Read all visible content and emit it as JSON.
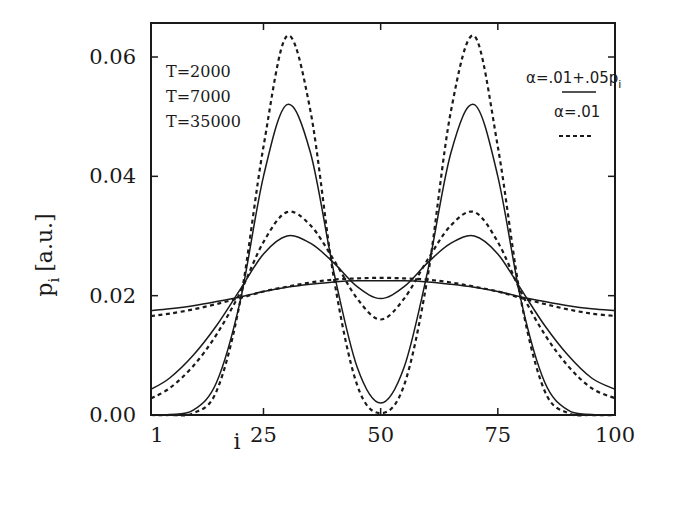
{
  "chart_data": {
    "type": "line",
    "title": "",
    "xlabel": "i",
    "ylabel": "p_i [a.u.]",
    "xlim": [
      1,
      100
    ],
    "ylim": [
      0.0,
      0.065
    ],
    "xticks": [
      1,
      25,
      50,
      75,
      100
    ],
    "yticks": [
      0.0,
      0.02,
      0.04,
      0.06
    ],
    "ytick_labels": [
      "0.00",
      "0.02",
      "0.04",
      "0.06"
    ],
    "xtick_labels": [
      "1",
      "25",
      "50",
      "75",
      "100"
    ],
    "grid": false,
    "annotations": [
      "T=2000",
      "T=7000",
      "T=35000"
    ],
    "legend": [
      {
        "label": "α=.01+.05p",
        "subscript": "i",
        "style": "solid"
      },
      {
        "label": "α=.01",
        "style": "dashed"
      }
    ],
    "legend_position": "upper right",
    "x": [
      1,
      5,
      10,
      15,
      20,
      25,
      30,
      35,
      40,
      45,
      50,
      55,
      60,
      65,
      70,
      75,
      80,
      85,
      90,
      95,
      100
    ],
    "series": [
      {
        "name": "T=2000, α=.01+.05p_i",
        "style": "solid",
        "values": [
          0.0175,
          0.0178,
          0.0183,
          0.019,
          0.0198,
          0.0207,
          0.0214,
          0.0219,
          0.0223,
          0.0225,
          0.0225,
          0.0225,
          0.0223,
          0.0219,
          0.0214,
          0.0207,
          0.0198,
          0.019,
          0.0183,
          0.0178,
          0.0175
        ]
      },
      {
        "name": "T=2000, α=.01",
        "style": "dashed",
        "values": [
          0.0166,
          0.017,
          0.0177,
          0.0186,
          0.0196,
          0.0207,
          0.0215,
          0.0222,
          0.0227,
          0.0229,
          0.023,
          0.0229,
          0.0227,
          0.0222,
          0.0215,
          0.0207,
          0.0196,
          0.0186,
          0.0177,
          0.017,
          0.0166
        ]
      },
      {
        "name": "T=7000, α=.01+.05p_i",
        "style": "solid",
        "values": [
          0.0043,
          0.0062,
          0.01,
          0.015,
          0.021,
          0.027,
          0.03,
          0.0288,
          0.0255,
          0.0215,
          0.0195,
          0.0215,
          0.0255,
          0.0288,
          0.03,
          0.027,
          0.021,
          0.015,
          0.01,
          0.0062,
          0.0043
        ]
      },
      {
        "name": "T=7000, α=.01",
        "style": "dashed",
        "values": [
          0.0028,
          0.0045,
          0.0082,
          0.0135,
          0.0205,
          0.029,
          0.034,
          0.0318,
          0.026,
          0.0195,
          0.016,
          0.0195,
          0.026,
          0.0318,
          0.034,
          0.029,
          0.0205,
          0.0135,
          0.0082,
          0.0045,
          0.0028
        ]
      },
      {
        "name": "T=35000, α=.01+.05p_i",
        "style": "solid",
        "values": [
          0.0,
          0.0001,
          0.0008,
          0.0055,
          0.019,
          0.04,
          0.052,
          0.044,
          0.024,
          0.008,
          0.002,
          0.008,
          0.024,
          0.044,
          0.052,
          0.04,
          0.019,
          0.0055,
          0.0008,
          0.0001,
          0.0
        ]
      },
      {
        "name": "T=35000, α=.01",
        "style": "dashed",
        "values": [
          0.0,
          0.0,
          0.0003,
          0.004,
          0.019,
          0.045,
          0.0635,
          0.051,
          0.023,
          0.005,
          0.0003,
          0.005,
          0.023,
          0.051,
          0.0635,
          0.045,
          0.019,
          0.004,
          0.0003,
          0.0,
          0.0
        ]
      }
    ]
  },
  "labels": {
    "ylabel_main": "p",
    "ylabel_sub": "i",
    "ylabel_units": "[a.u.]",
    "xlabel": "i",
    "t_labels": [
      "T=2000",
      "T=7000",
      "T=35000"
    ],
    "legend_solid_main": "α=.01+.05p",
    "legend_solid_sub": "i",
    "legend_dashed": "α=.01"
  }
}
